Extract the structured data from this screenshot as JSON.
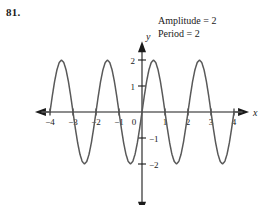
{
  "problem": {
    "number": "81."
  },
  "annotations": {
    "amplitude": "Amplitude = 2",
    "period": "Period = 2"
  },
  "axes": {
    "x_label": "x",
    "y_label": "y",
    "origin_label": "0"
  },
  "chart_data": {
    "type": "line",
    "title": "",
    "subtitle": "",
    "xlabel": "x",
    "ylabel": "y",
    "function": "y = 2 sin(pi x)",
    "amplitude": 2,
    "period": 2,
    "xlim": [
      -4.35,
      4.35
    ],
    "ylim": [
      -2.45,
      2.45
    ],
    "grid": false,
    "legend": "none",
    "x_ticks": [
      -4,
      -3,
      -2,
      -1,
      0,
      1,
      2,
      3,
      4
    ],
    "x_tick_labels": [
      "−4",
      "−3",
      "−2",
      "−1",
      "0",
      "1",
      "2",
      "3",
      "4"
    ],
    "y_ticks": [
      -2,
      -1,
      1,
      2
    ],
    "y_tick_labels": [
      "−2",
      "−1",
      "1",
      "2"
    ],
    "series": [
      {
        "name": "y = 2 sin(pi x)",
        "color": "#595959",
        "x": [
          -4.0,
          -3.9,
          -3.8,
          -3.7,
          -3.6,
          -3.5,
          -3.4,
          -3.3,
          -3.2,
          -3.1,
          -3.0,
          -2.9,
          -2.8,
          -2.7,
          -2.6,
          -2.5,
          -2.4,
          -2.3,
          -2.2,
          -2.1,
          -2.0,
          -1.9,
          -1.8,
          -1.7,
          -1.6,
          -1.5,
          -1.4,
          -1.3,
          -1.2,
          -1.1,
          -1.0,
          -0.9,
          -0.8,
          -0.7,
          -0.6,
          -0.5,
          -0.4,
          -0.3,
          -0.2,
          -0.1,
          0.0,
          0.1,
          0.2,
          0.3,
          0.4,
          0.5,
          0.6,
          0.7,
          0.8,
          0.9,
          1.0,
          1.1,
          1.2,
          1.3,
          1.4,
          1.5,
          1.6,
          1.7,
          1.8,
          1.9,
          2.0,
          2.1,
          2.2,
          2.3,
          2.4,
          2.5,
          2.6,
          2.7,
          2.8,
          2.9,
          3.0,
          3.1,
          3.2,
          3.3,
          3.4,
          3.5,
          3.6,
          3.7,
          3.8,
          3.9,
          4.0
        ],
        "y": [
          0.0,
          0.618,
          1.176,
          1.618,
          1.902,
          2.0,
          1.902,
          1.618,
          1.176,
          0.618,
          0.0,
          -0.618,
          -1.176,
          -1.618,
          -1.902,
          -2.0,
          -1.902,
          -1.618,
          -1.176,
          -0.618,
          0.0,
          0.618,
          1.176,
          1.618,
          1.902,
          2.0,
          1.902,
          1.618,
          1.176,
          0.618,
          0.0,
          -0.618,
          -1.176,
          -1.618,
          -1.902,
          -2.0,
          -1.902,
          -1.618,
          -1.176,
          -0.618,
          0.0,
          0.618,
          1.176,
          1.618,
          1.902,
          2.0,
          1.902,
          1.618,
          1.176,
          0.618,
          0.0,
          -0.618,
          -1.176,
          -1.618,
          -1.902,
          -2.0,
          -1.902,
          -1.618,
          -1.176,
          -0.618,
          0.0,
          0.618,
          1.176,
          1.618,
          1.902,
          2.0,
          1.902,
          1.618,
          1.176,
          0.618,
          0.0,
          -0.618,
          -1.176,
          -1.618,
          -1.902,
          -2.0,
          -1.902,
          -1.618,
          -1.176,
          -0.618,
          0.0
        ]
      }
    ],
    "annotations": [
      "Amplitude = 2",
      "Period = 2"
    ]
  },
  "colors": {
    "curve": "#595959",
    "axis": "#1a1a1a",
    "text": "#1a1a1a",
    "background": "#ffffff"
  }
}
